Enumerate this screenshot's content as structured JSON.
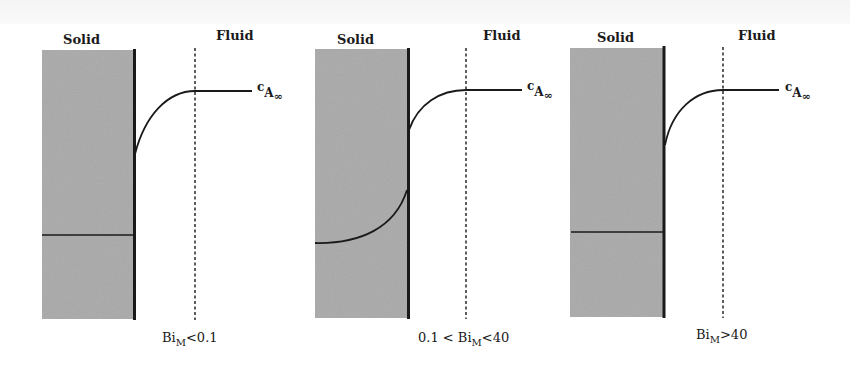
{
  "figure": {
    "panels": [
      {
        "solid_label": "Solid",
        "fluid_label": "Fluid",
        "concentration_label": "c",
        "concentration_sub": "A",
        "concentration_subsub": "∞",
        "caption_prefix": "",
        "caption_main": "Bi",
        "caption_sub": "M",
        "caption_suffix": "<0.1",
        "regime": "uniform concentration in solid, gradient in fluid"
      },
      {
        "solid_label": "Solid",
        "fluid_label": "Fluid",
        "concentration_label": "c",
        "concentration_sub": "A",
        "concentration_subsub": "∞",
        "caption_prefix": "0.1 < ",
        "caption_main": "Bi",
        "caption_sub": "M",
        "caption_suffix": "<40",
        "regime": "gradients in both solid and fluid"
      },
      {
        "solid_label": "Solid",
        "fluid_label": "Fluid",
        "concentration_label": "c",
        "concentration_sub": "A",
        "concentration_subsub": "∞",
        "caption_prefix": "",
        "caption_main": "Bi",
        "caption_sub": "M",
        "caption_suffix": ">40",
        "regime": "uniform concentration in fluid at surface, gradient in solid"
      }
    ],
    "colors": {
      "solid_fill": "#a9a9a9",
      "line": "#1a1a1a",
      "background": "#ffffff"
    }
  }
}
